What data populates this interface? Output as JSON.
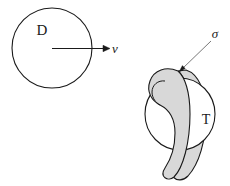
{
  "figure": {
    "background_color": "#ffffff",
    "stroke_color": "#1a1a1a",
    "band_fill_color": "#d8d8d8",
    "body_fill_color": "#ffffff",
    "left_panel": {
      "disk_label": "D",
      "velocity_label": "v",
      "disk": {
        "center_x": 52,
        "center_y": 48,
        "radius": 40
      },
      "arrow": {
        "start_x": 52,
        "start_y": 48,
        "end_x": 108,
        "end_y": 48
      }
    },
    "right_panel": {
      "band_label": "σ",
      "sphere_label": "T",
      "sphere": {
        "center_x": 180,
        "center_y": 114,
        "radius_x": 35,
        "radius_y": 36
      },
      "leader_line": {
        "start_x": 212,
        "start_y": 40,
        "end_x": 180,
        "end_y": 71
      }
    }
  }
}
